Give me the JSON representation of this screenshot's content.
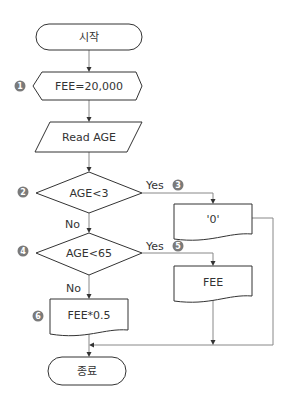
{
  "flowchart": {
    "start": {
      "label": "시작"
    },
    "init": {
      "label": "FEE=20,000",
      "badge": "1"
    },
    "input": {
      "label": "Read AGE"
    },
    "decision1": {
      "label": "AGE<3",
      "badge": "2",
      "yes_label": "Yes",
      "no_label": "No"
    },
    "output_zero": {
      "label": "'0'",
      "badge": "3"
    },
    "decision2": {
      "label": "AGE<65",
      "badge": "4",
      "yes_label": "Yes",
      "no_label": "No"
    },
    "output_fee": {
      "label": "FEE",
      "badge": "5"
    },
    "output_half": {
      "label": "FEE*0.5",
      "badge": "6"
    },
    "end": {
      "label": "종료"
    }
  },
  "colors": {
    "stroke": "#333333",
    "connector": "#888888",
    "badge": "#7a7a7a"
  }
}
